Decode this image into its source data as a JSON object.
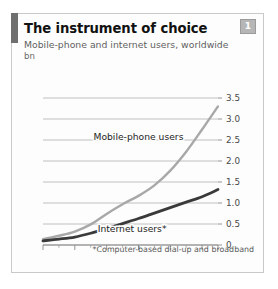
{
  "panel": {
    "title": "The instrument of choice",
    "subtitle": "Mobile-phone and internet users, worldwide",
    "unit": "bn",
    "badge": "1",
    "footnote": "*Computer-based dial-up and broadband",
    "accent_color": "#6f6f6f",
    "badge_color": "#b6b6b6",
    "border_color": "#c9c9c9"
  },
  "chart_data": {
    "type": "line",
    "title": "The instrument of choice",
    "subtitle": "Mobile-phone and internet users, worldwide",
    "xlabel": "",
    "ylabel": "bn",
    "unit": "bn",
    "ylim": [
      0,
      3.5
    ],
    "ytick_labels": [
      "3.5",
      "3.0",
      "2.5",
      "2.0",
      "1.5",
      "1.0",
      "0.5",
      "0"
    ],
    "yticks": [
      3.5,
      3.0,
      2.5,
      2.0,
      1.5,
      1.0,
      0.5,
      0
    ],
    "grid": true,
    "legend": "inline-labels",
    "x": [
      1996,
      1997,
      1998,
      1999,
      2000,
      2001,
      2002,
      2003,
      2004,
      2005,
      2006,
      2007
    ],
    "xlim": [
      1996,
      2007
    ],
    "xtick_labels": [
      "1996",
      "98",
      "2000",
      "02",
      "04",
      "06",
      "07"
    ],
    "xtick_values": [
      1996,
      1998,
      2000,
      2002,
      2004,
      2006,
      2007
    ],
    "series": [
      {
        "name": "Mobile-phone users",
        "color": "#a8a8a8",
        "width": 2.4,
        "values": [
          0.14,
          0.22,
          0.32,
          0.49,
          0.74,
          0.97,
          1.17,
          1.42,
          1.77,
          2.22,
          2.75,
          3.3
        ]
      },
      {
        "name": "Internet users*",
        "color": "#3a3a3a",
        "width": 2.8,
        "values": [
          0.1,
          0.14,
          0.19,
          0.28,
          0.39,
          0.51,
          0.63,
          0.76,
          0.89,
          1.02,
          1.15,
          1.32
        ]
      }
    ],
    "annotations": [
      {
        "text": "Mobile-phone users",
        "x": 2002.0,
        "y": 2.5
      },
      {
        "text": "Internet users*",
        "x": 2001.6,
        "y": 0.3
      }
    ]
  }
}
